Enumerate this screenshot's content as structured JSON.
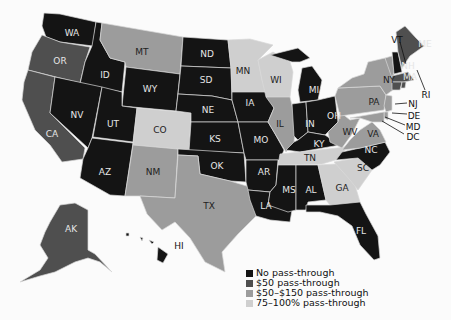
{
  "map": {
    "title": "",
    "categories": {
      "none": {
        "label": "No pass-through",
        "color": "#141414"
      },
      "fifty": {
        "label": "$50 pass-through",
        "color": "#4f4f4f"
      },
      "fifty150": {
        "label": "$50–$150 pass-through",
        "color": "#9c9c9c"
      },
      "pct": {
        "label": "75–100% pass-through",
        "color": "#cfcfcf"
      }
    },
    "states": {
      "WA": "none",
      "OR": "fifty",
      "CA": "fifty",
      "ID": "none",
      "NV": "none",
      "MT": "fifty150",
      "WY": "none",
      "UT": "none",
      "AZ": "none",
      "CO": "pct",
      "NM": "fifty150",
      "ND": "none",
      "SD": "none",
      "NE": "none",
      "KS": "none",
      "OK": "none",
      "TX": "fifty150",
      "MN": "pct",
      "IA": "none",
      "MO": "none",
      "AR": "none",
      "LA": "none",
      "WI": "pct",
      "IL": "fifty150",
      "MI": "none",
      "IN": "none",
      "OH": "none",
      "KY": "none",
      "TN": "pct",
      "MS": "none",
      "AL": "none",
      "GA": "pct",
      "FL": "none",
      "SC": "pct",
      "NC": "none",
      "VA": "fifty150",
      "WV": "fifty150",
      "PA": "fifty150",
      "NY": "fifty150",
      "NJ": "fifty150",
      "DE": "fifty150",
      "MD": "fifty150",
      "DC": "fifty150",
      "VT": "fifty150",
      "NH": "none",
      "ME": "fifty",
      "MA": "fifty",
      "CT": "fifty",
      "RI": "fifty",
      "AK": "fifty",
      "HI": "none"
    },
    "labels": {
      "WA": "WA",
      "OR": "OR",
      "CA": "CA",
      "ID": "ID",
      "NV": "NV",
      "MT": "MT",
      "WY": "WY",
      "UT": "UT",
      "AZ": "AZ",
      "CO": "CO",
      "NM": "NM",
      "ND": "ND",
      "SD": "SD",
      "NE": "NE",
      "KS": "KS",
      "OK": "OK",
      "TX": "TX",
      "MN": "MN",
      "IA": "IA",
      "MO": "MO",
      "AR": "AR",
      "LA": "LA",
      "WI": "WI",
      "IL": "IL",
      "MI": "MI",
      "IN": "IN",
      "OH": "OH",
      "KY": "KY",
      "TN": "TN",
      "MS": "MS",
      "AL": "AL",
      "GA": "GA",
      "FL": "FL",
      "SC": "SC",
      "NC": "NC",
      "VA": "VA",
      "WV": "WV",
      "PA": "PA",
      "NY": "NY",
      "NJ": "NJ",
      "DE": "DE",
      "MD": "MD",
      "DC": "DC",
      "VT": "VT",
      "NH": "NH",
      "ME": "ME",
      "MA": "MA",
      "RI": "RI",
      "AK": "AK",
      "HI": "HI"
    }
  },
  "legend": {
    "items": [
      {
        "label": "No pass-through",
        "color": "#141414"
      },
      {
        "label": "$50 pass-through",
        "color": "#4f4f4f"
      },
      {
        "label": "$50–$150 pass-through",
        "color": "#9c9c9c"
      },
      {
        "label": "75–100% pass-through",
        "color": "#cfcfcf"
      }
    ]
  }
}
